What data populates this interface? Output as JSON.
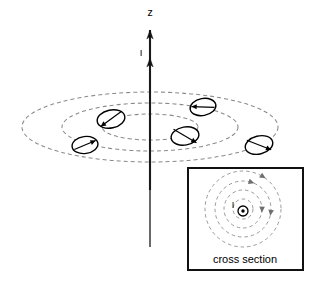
{
  "figure": {
    "title": "",
    "axis_label": "z",
    "current_label": "I",
    "wire": {
      "x": 150,
      "y_top": 30,
      "y_bottom": 247,
      "color": "#1a1a1a"
    },
    "axis_arrow": {
      "name": "z-axis-arrowhead",
      "x": 150,
      "y": 30
    },
    "current_arrow": {
      "name": "current-direction-arrowhead",
      "x": 150,
      "y": 58
    },
    "z_label_pos": {
      "x": 150,
      "y": 16
    },
    "current_label_pos": {
      "x": 141,
      "y": 56
    },
    "field_lines": {
      "name": "magnetic-field-ellipses",
      "count": 3,
      "color": "#8a8a8a",
      "dash": "4,3",
      "center": {
        "x": 150,
        "y": 127
      },
      "ellipses": [
        {
          "rx": 128,
          "ry": 35
        },
        {
          "rx": 88,
          "ry": 24
        },
        {
          "rx": 48,
          "ry": 13
        }
      ]
    },
    "compasses": [
      {
        "name": "compass-needle-1",
        "cx": 111,
        "cy": 119,
        "rx": 14,
        "ry": 9,
        "rot": -12,
        "needle_deg": 200,
        "label": "compass"
      },
      {
        "name": "compass-needle-2",
        "cx": 203,
        "cy": 107,
        "rx": 13,
        "ry": 8.5,
        "rot": -10,
        "needle_deg": 170,
        "label": "compass"
      },
      {
        "name": "compass-needle-3",
        "cx": 185,
        "cy": 136,
        "rx": 14,
        "ry": 9,
        "rot": -10,
        "needle_deg": 325,
        "label": "compass"
      },
      {
        "name": "compass-needle-4",
        "cx": 85,
        "cy": 145,
        "rx": 13,
        "ry": 8.5,
        "rot": -8,
        "needle_deg": 12,
        "label": "compass"
      },
      {
        "name": "compass-needle-5",
        "cx": 259,
        "cy": 145,
        "rx": 14,
        "ry": 9,
        "rot": -14,
        "needle_deg": 330,
        "label": "compass"
      }
    ],
    "inset": {
      "name": "cross-section-inset",
      "caption": "cross section",
      "current_label": "I",
      "box": {
        "x": 188,
        "y": 168,
        "w": 115,
        "h": 102
      },
      "border_color": "#111111",
      "center": {
        "x": 243,
        "y": 209
      },
      "circles": [
        {
          "r": 38
        },
        {
          "r": 28
        },
        {
          "r": 19
        },
        {
          "r": 10
        }
      ],
      "circle_color": "#9a9a9a",
      "dash": "3.5,3",
      "current_symbol": {
        "name": "current-out-of-page-dot",
        "cx": 243,
        "cy": 211,
        "r": 5
      },
      "caption_pos": {
        "x": 245,
        "y": 263
      },
      "current_label_pos": {
        "x": 233,
        "y": 208
      },
      "arrows": [
        {
          "name": "field-arrow-outer",
          "cx": 243,
          "cy": 209,
          "r": 38,
          "angle_deg": -58,
          "dir": "ccw"
        },
        {
          "name": "field-arrow-mid",
          "cx": 243,
          "cy": 209,
          "r": 28,
          "angle_deg": -72,
          "dir": "ccw"
        },
        {
          "name": "field-arrow-right",
          "cx": 243,
          "cy": 209,
          "r": 28,
          "angle_deg": 8,
          "dir": "ccw"
        },
        {
          "name": "field-arrow-inner",
          "cx": 243,
          "cy": 209,
          "r": 19,
          "angle_deg": 2,
          "dir": "ccw"
        }
      ]
    }
  },
  "chart_data": {
    "type": "diagram",
    "xlabel": "",
    "ylabel": "z",
    "annotations": [
      "z",
      "I",
      "I",
      "cross section"
    ],
    "series": [
      {
        "name": "field-line-outer",
        "shape": "ellipse",
        "rx": 128,
        "ry": 35
      },
      {
        "name": "field-line-middle",
        "shape": "ellipse",
        "rx": 88,
        "ry": 24
      },
      {
        "name": "field-line-inner",
        "shape": "ellipse",
        "rx": 48,
        "ry": 13
      }
    ],
    "legend_position": "none",
    "grid": false
  }
}
